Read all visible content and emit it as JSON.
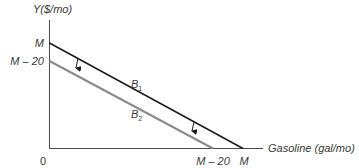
{
  "diagram": {
    "y_axis_label": "Y($/mo)",
    "x_axis_label": "Gasoline (gal/mo)",
    "origin_label": "0",
    "y_ticks": [
      {
        "label": "M"
      },
      {
        "label": "M – 20"
      }
    ],
    "x_ticks": [
      {
        "label": "M – 20"
      },
      {
        "label": "M"
      }
    ],
    "lines": [
      {
        "name": "B",
        "subscript": "1",
        "color": "#1a1a1a"
      },
      {
        "name": "B",
        "subscript": "2",
        "color": "#808080"
      }
    ],
    "arrows": {
      "count": 2,
      "direction": "down",
      "meaning": "shift from B1 to B2"
    }
  }
}
